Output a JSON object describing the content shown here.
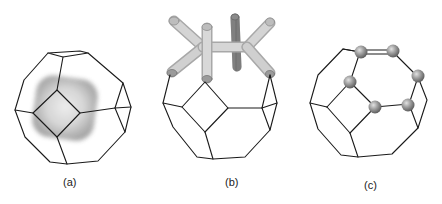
{
  "figure": {
    "panels": [
      {
        "id": "a",
        "label": "(a)",
        "description": "truncated octahedron cage with shaded density blob around square face"
      },
      {
        "id": "b",
        "label": "(b)",
        "description": "truncated octahedron cage with branching tube network above"
      },
      {
        "id": "c",
        "label": "(c)",
        "description": "truncated octahedron cage with six spheres on vertices"
      }
    ],
    "colors": {
      "edge": "#1a1a1a",
      "blob_outer": "#a9a9a9",
      "blob_inner": "#e6e6e6",
      "tube_light": "#d2d2d2",
      "tube_shadow": "#9a9a9a",
      "tube_dark": "#7a7a7a",
      "sphere_light": "#d8d8d8",
      "sphere_dark": "#6e6e6e",
      "background": "#ffffff"
    }
  }
}
